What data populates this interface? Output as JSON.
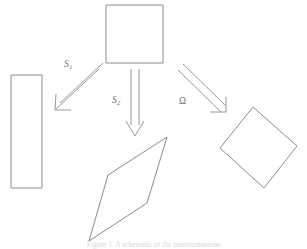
{
  "figure": {
    "type": "math-transformation-diagram",
    "background_color": "#ffffff",
    "stroke_color": "#8c8c8c",
    "label_color": "#6f6f6f",
    "caption": "Figure 1.  A schematic of the transformations",
    "shapes": [
      {
        "id": "source-square",
        "name": "square",
        "role": "source",
        "points": "106,5 163,5 163,63 106,63"
      },
      {
        "id": "target-rectangle",
        "name": "tall-rectangle",
        "role": "target",
        "points": "11,75 42,75 42,188 11,188"
      },
      {
        "id": "target-parallelogram",
        "name": "parallelogram",
        "role": "target",
        "points": "167,137 147,203 89,241 108,175"
      },
      {
        "id": "target-diamond",
        "name": "rotated-square",
        "role": "target",
        "points": "253,107 297,146 264,188 220,148"
      }
    ],
    "arrows": [
      {
        "id": "arrow-s1",
        "label": "S",
        "subscript": "1",
        "from": "source-square",
        "to": "target-rectangle",
        "start": [
          100,
          66
        ],
        "end": [
          57,
          106
        ],
        "style": "double-line-open-head"
      },
      {
        "id": "arrow-s2",
        "label": "S",
        "subscript": "2",
        "from": "source-square",
        "to": "target-parallelogram",
        "start": [
          135,
          69
        ],
        "end": [
          135,
          135
        ],
        "style": "double-line-open-head"
      },
      {
        "id": "arrow-omega",
        "label": "Ω",
        "subscript": "",
        "from": "source-square",
        "to": "target-diamond",
        "start": [
          180,
          68
        ],
        "end": [
          224,
          111
        ],
        "style": "double-line-open-head"
      }
    ]
  }
}
